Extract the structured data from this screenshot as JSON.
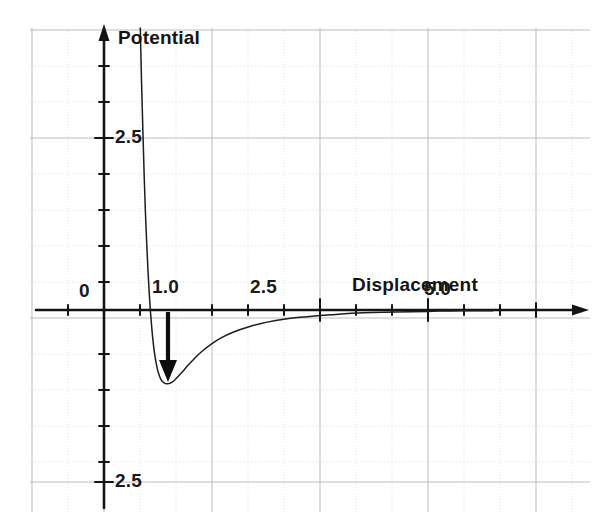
{
  "figure": {
    "kind": "scanned-line-graph",
    "background_color": "#ffffff",
    "ink_color": "#1a1a1a",
    "grid_minor_color": "#d8d8d8",
    "grid_major_color": "#b4b4b4"
  },
  "labels": {
    "y_axis_title": "Potential",
    "x_axis_title": "Displacement",
    "x_tick_0": "0",
    "x_tick_1": "1.0",
    "x_tick_2": "2.5",
    "x_tick_3": "5.0",
    "y_tick_pos": "2.5",
    "y_tick_neg": "2.5"
  },
  "chart_data": {
    "type": "line",
    "title": "",
    "xlabel": "Displacement",
    "ylabel": "Potential",
    "xlim": [
      -0.65,
      9.0
    ],
    "ylim": [
      -2.9,
      4.1
    ],
    "grid": true,
    "legend": null,
    "annotations": [
      {
        "name": "well-depth-arrow",
        "kind": "arrow",
        "x": 1.0,
        "y_start": 0.0,
        "y_end": -1.07,
        "direction": "down",
        "description": "bold arrow from the displacement axis down to the potential minimum"
      }
    ],
    "x_ticks": [
      {
        "value": 0.0,
        "label": "0"
      },
      {
        "value": 1.0,
        "label": "1.0"
      },
      {
        "value": 2.5,
        "label": "2.5"
      },
      {
        "value": 5.0,
        "label": "5.0"
      }
    ],
    "y_ticks": [
      {
        "value": 2.5,
        "label": "2.5"
      },
      {
        "value": -2.5,
        "label": "2.5"
      }
    ],
    "series": [
      {
        "name": "Lennard-Jones potential",
        "x": [
          0.56,
          0.58,
          0.6,
          0.62,
          0.64,
          0.66,
          0.68,
          0.7,
          0.72,
          0.75,
          0.78,
          0.82,
          0.86,
          0.9,
          0.95,
          1.0,
          1.05,
          1.1,
          1.15,
          1.2,
          1.3,
          1.4,
          1.5,
          1.65,
          1.8,
          2.0,
          2.25,
          2.5,
          2.8,
          3.1,
          3.5,
          4.0,
          4.5,
          5.0,
          5.5,
          6.0
        ],
        "y": [
          4.1,
          3.3,
          2.6,
          1.95,
          1.4,
          0.95,
          0.55,
          0.22,
          -0.06,
          -0.39,
          -0.63,
          -0.84,
          -0.97,
          -1.04,
          -1.07,
          -1.07,
          -1.05,
          -1.01,
          -0.96,
          -0.91,
          -0.8,
          -0.7,
          -0.61,
          -0.5,
          -0.41,
          -0.32,
          -0.24,
          -0.18,
          -0.13,
          -0.1,
          -0.07,
          -0.04,
          -0.03,
          -0.02,
          -0.01,
          -0.01
        ]
      }
    ]
  }
}
